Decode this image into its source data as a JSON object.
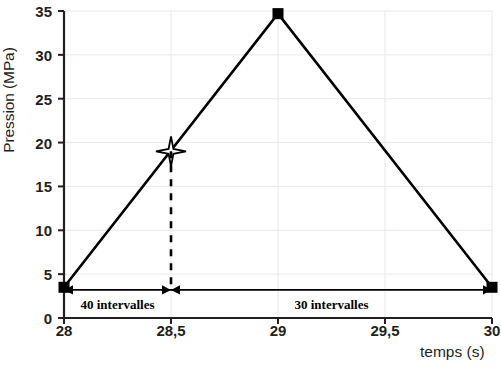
{
  "chart_data": {
    "type": "line",
    "title": "",
    "xlabel": "temps (s)",
    "ylabel": "Pression (MPa)",
    "xlim": [
      28,
      30
    ],
    "ylim": [
      0,
      35
    ],
    "grid": true,
    "legend": null,
    "x": [
      28,
      29,
      30
    ],
    "values": [
      3.5,
      34.7,
      3.5
    ],
    "series": [
      {
        "name": "Pression",
        "x": [
          28,
          29,
          30
        ],
        "values": [
          3.5,
          34.7,
          3.5
        ],
        "marker": "square",
        "color": "#000000"
      }
    ],
    "xticks": [
      28,
      28.5,
      29,
      29.5,
      30
    ],
    "xticklabels": [
      "28",
      "28,5",
      "29",
      "29,5",
      "30"
    ],
    "yticks": [
      0,
      5,
      10,
      15,
      20,
      25,
      30,
      35
    ],
    "yticklabels": [
      "0",
      "5",
      "10",
      "15",
      "20",
      "25",
      "30",
      "35"
    ],
    "annotations": [
      {
        "name": "star-marker",
        "shape": "4-point-star",
        "x": 28.5,
        "y": 19.0,
        "label": ""
      },
      {
        "name": "dashed-drop-line",
        "shape": "dashed-vertical",
        "x": 28.5,
        "y_from": 19.0,
        "y_to": 3.5
      },
      {
        "name": "interval-span-left",
        "shape": "double-arrow",
        "x_from": 28,
        "x_to": 28.5,
        "y": 3.2,
        "label": "40 intervalles"
      },
      {
        "name": "interval-span-right",
        "shape": "double-arrow",
        "x_from": 28.5,
        "x_to": 30,
        "y": 3.2,
        "label": "30 intervalles"
      }
    ]
  },
  "axes": {
    "y_title": "Pression (MPa)",
    "x_title": "temps (s)"
  },
  "colors": {
    "line": "#000000",
    "grid": "#e9e6ef",
    "axis": "#231f20",
    "text": "#231f20"
  }
}
